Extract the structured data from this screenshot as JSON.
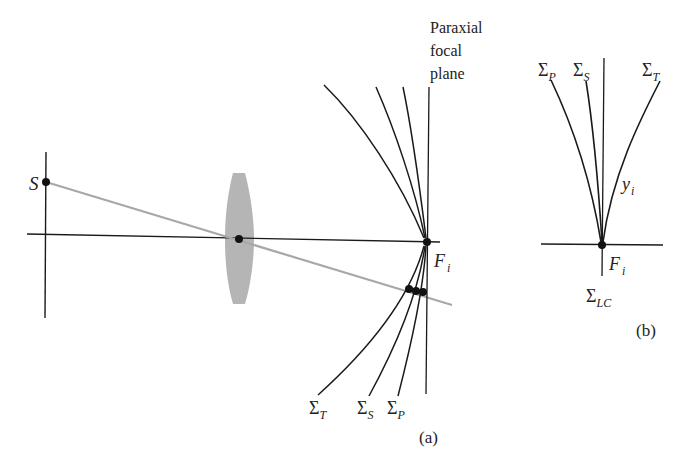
{
  "figure": {
    "panel_a": {
      "caption": "(a)",
      "source_label": "S",
      "focal_point_label": "F",
      "focal_point_sub": "i",
      "plane_label_lines": [
        "Paraxial",
        "focal",
        "plane"
      ],
      "surface_labels": [
        {
          "main": "Σ",
          "sub": "T"
        },
        {
          "main": "Σ",
          "sub": "S"
        },
        {
          "main": "Σ",
          "sub": "P"
        }
      ]
    },
    "panel_b": {
      "caption": "(b)",
      "surface_labels": [
        {
          "main": "Σ",
          "sub": "P"
        },
        {
          "main": "Σ",
          "sub": "S"
        },
        {
          "main": "Σ",
          "sub": "T"
        }
      ],
      "height_label": "y",
      "height_sub": "i",
      "focal_point_label": "F",
      "focal_point_sub": "i",
      "bottom_label": "Σ",
      "bottom_sub": "LC"
    },
    "colors": {
      "line": "#1a1a1a",
      "ray": "#a8a8a8",
      "lens": "#b5b5b5",
      "background": "#ffffff"
    }
  }
}
